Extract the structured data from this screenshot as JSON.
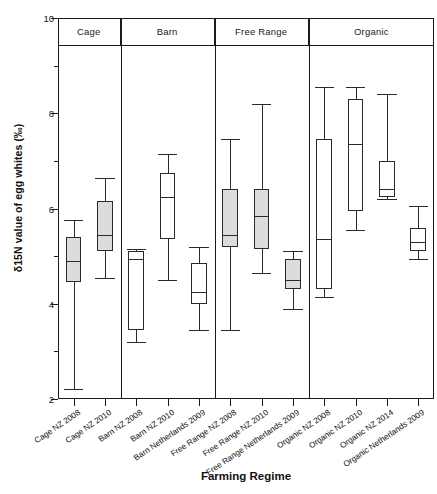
{
  "chart_data": {
    "type": "box",
    "title": "",
    "xlabel": "Farming Regime",
    "ylabel": "δ15N value of egg whites (‰)",
    "ylim": [
      2,
      10
    ],
    "yticks": [
      2,
      4,
      6,
      8,
      10
    ],
    "ytick_labels": [
      "2",
      "4",
      "6",
      "8",
      "10"
    ],
    "yminor_ticks": [
      3,
      5,
      7,
      9
    ],
    "grid": false,
    "legend": "none",
    "panels": [
      {
        "label": "Cage",
        "n": 2
      },
      {
        "label": "Barn",
        "n": 3
      },
      {
        "label": "Free Range",
        "n": 3
      },
      {
        "label": "Organic",
        "n": 4
      }
    ],
    "categories": [
      "Cage NZ 2008",
      "Cage NZ 2010",
      "Barn NZ 2008",
      "Barn NZ 2010",
      "Barn Netherlands 2009",
      "Free Range NZ 2008",
      "Free Range NZ 2010",
      "Free Range Netherlands 2009",
      "Organic NZ 2008",
      "Organic NZ 2010",
      "Organic NZ 2014",
      "Organic Netherlands 2009"
    ],
    "boxes": [
      {
        "label": "Cage NZ 2008",
        "panel": "Cage",
        "whisker_low": 2.22,
        "q1": 4.45,
        "median": 4.9,
        "q3": 5.4,
        "whisker_high": 5.75,
        "fill": "#dcdcdc"
      },
      {
        "label": "Cage NZ 2010",
        "panel": "Cage",
        "whisker_low": 4.55,
        "q1": 5.1,
        "median": 5.45,
        "q3": 6.15,
        "whisker_high": 6.65,
        "fill": "#dcdcdc"
      },
      {
        "label": "Barn NZ 2008",
        "panel": "Barn",
        "whisker_low": 3.2,
        "q1": 3.45,
        "median": 4.95,
        "q3": 5.1,
        "whisker_high": 5.15,
        "fill": "#ffffff"
      },
      {
        "label": "Barn NZ 2010",
        "panel": "Barn",
        "whisker_low": 4.5,
        "q1": 5.35,
        "median": 6.25,
        "q3": 6.75,
        "whisker_high": 7.15,
        "fill": "#ffffff"
      },
      {
        "label": "Barn Netherlands 2009",
        "panel": "Barn",
        "whisker_low": 3.45,
        "q1": 4.0,
        "median": 4.25,
        "q3": 4.85,
        "whisker_high": 5.2,
        "fill": "#ffffff"
      },
      {
        "label": "Free Range NZ 2008",
        "panel": "Free Range",
        "whisker_low": 3.45,
        "q1": 5.2,
        "median": 5.45,
        "q3": 6.4,
        "whisker_high": 7.45,
        "fill": "#dcdcdc"
      },
      {
        "label": "Free Range NZ 2010",
        "panel": "Free Range",
        "whisker_low": 4.65,
        "q1": 5.15,
        "median": 5.85,
        "q3": 6.4,
        "whisker_high": 8.2,
        "fill": "#dcdcdc"
      },
      {
        "label": "Free Range Netherlands 2009",
        "panel": "Free Range",
        "whisker_low": 3.9,
        "q1": 4.3,
        "median": 4.5,
        "q3": 4.95,
        "whisker_high": 5.1,
        "fill": "#dcdcdc"
      },
      {
        "label": "Organic NZ 2008",
        "panel": "Organic",
        "whisker_low": 4.15,
        "q1": 4.3,
        "median": 5.35,
        "q3": 7.45,
        "whisker_high": 8.55,
        "fill": "#ffffff"
      },
      {
        "label": "Organic NZ 2010",
        "panel": "Organic",
        "whisker_low": 5.55,
        "q1": 5.95,
        "median": 7.35,
        "q3": 8.3,
        "whisker_high": 8.55,
        "fill": "#ffffff"
      },
      {
        "label": "Organic NZ 2014",
        "panel": "Organic",
        "whisker_low": 6.2,
        "q1": 6.25,
        "median": 6.4,
        "q3": 7.0,
        "whisker_high": 8.4,
        "fill": "#ffffff"
      },
      {
        "label": "Organic Netherlands 2009",
        "panel": "Organic",
        "whisker_low": 4.95,
        "q1": 5.1,
        "median": 5.3,
        "q3": 5.6,
        "whisker_high": 6.05,
        "fill": "#ffffff"
      }
    ],
    "colors": {
      "axis": "#1a1a1a",
      "box_outline": "#2a2a2a",
      "fill_nz_shaded": "#dcdcdc",
      "fill_open": "#ffffff",
      "background": "#ffffff"
    }
  }
}
